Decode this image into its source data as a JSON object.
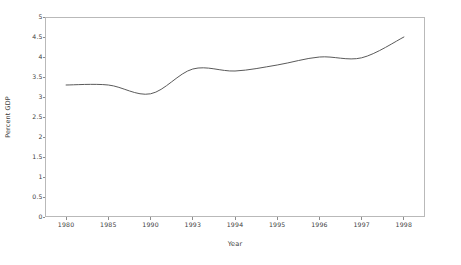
{
  "chart_data": {
    "type": "line",
    "title": "",
    "xlabel": "Year",
    "ylabel": "Percent GDP",
    "grid": false,
    "legend": "none",
    "x_tick_labels": [
      "1980",
      "1985",
      "1990",
      "1993",
      "1994",
      "1995",
      "1996",
      "1997",
      "1998"
    ],
    "y_tick_labels": [
      "0",
      "0.5",
      "1",
      "1.5",
      "2",
      "2.5",
      "3",
      "3.5",
      "4",
      "4.5",
      "5"
    ],
    "ylim": [
      0,
      5
    ],
    "y_tick_values": [
      0,
      0.5,
      1,
      1.5,
      2,
      2.5,
      3,
      3.5,
      4,
      4.5,
      5
    ],
    "categories": [
      "1980",
      "1985",
      "1990",
      "1993",
      "1994",
      "1995",
      "1996",
      "1997",
      "1998"
    ],
    "values": [
      3.3,
      3.3,
      3.08,
      3.7,
      3.65,
      3.8,
      4.0,
      3.98,
      4.5
    ],
    "series": [
      {
        "name": "Percent GDP",
        "color": "#5a5a5a",
        "values": [
          3.3,
          3.3,
          3.08,
          3.7,
          3.65,
          3.8,
          4.0,
          3.98,
          4.5
        ]
      }
    ],
    "line_color": "#5a5a5a",
    "axis_color": "#b9b9b9",
    "background": "#ffffff"
  },
  "axes": {
    "x_title": "Year",
    "y_title": "Percent GDP"
  }
}
